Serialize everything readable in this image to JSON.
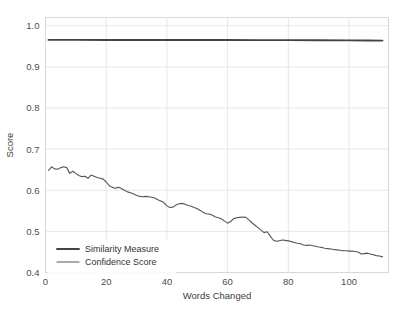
{
  "chart_data": {
    "type": "line",
    "title": "",
    "xlabel": "Words Changed",
    "ylabel": "Score",
    "xlim": [
      0,
      113
    ],
    "ylim": [
      0.4,
      1.02
    ],
    "xticks": [
      0,
      20,
      40,
      60,
      80,
      100
    ],
    "xtick_labels": [
      "0",
      "20",
      "40",
      "60",
      "80",
      "100"
    ],
    "yticks": [
      0.4,
      0.5,
      0.6,
      0.7,
      0.8,
      0.9,
      1.0
    ],
    "ytick_labels": [
      "0.4",
      "0.5",
      "0.6",
      "0.7",
      "0.8",
      "0.9",
      "1.0"
    ],
    "grid": true,
    "legend_position": "lower left",
    "colors": {
      "similarity_measure": "#444444",
      "confidence_score": "#555555",
      "grid": "#e3e3e3",
      "frame": "#d9d9d9",
      "text": "#3d3d3d"
    },
    "series": [
      {
        "name": "Similarity Measure",
        "x": [
          1,
          10,
          20,
          30,
          40,
          50,
          60,
          70,
          80,
          90,
          100,
          106,
          111
        ],
        "values": [
          0.9655,
          0.9655,
          0.9654,
          0.9654,
          0.9653,
          0.9653,
          0.9652,
          0.9651,
          0.965,
          0.9648,
          0.9645,
          0.9642,
          0.9638
        ]
      },
      {
        "name": "Confidence Score",
        "x": [
          1,
          2,
          3,
          4,
          5,
          6,
          7,
          8,
          9,
          10,
          11,
          12,
          13,
          14,
          15,
          16,
          17,
          18,
          19,
          20,
          21,
          22,
          23,
          24,
          25,
          26,
          27,
          28,
          29,
          30,
          31,
          32,
          33,
          34,
          35,
          36,
          37,
          38,
          39,
          40,
          41,
          42,
          43,
          44,
          45,
          46,
          47,
          48,
          49,
          50,
          51,
          52,
          53,
          54,
          55,
          56,
          57,
          58,
          59,
          60,
          61,
          62,
          63,
          64,
          65,
          66,
          67,
          68,
          69,
          70,
          71,
          72,
          73,
          74,
          75,
          76,
          77,
          78,
          79,
          80,
          81,
          82,
          83,
          84,
          85,
          86,
          87,
          88,
          89,
          90,
          91,
          92,
          93,
          94,
          95,
          96,
          97,
          98,
          99,
          100,
          101,
          102,
          103,
          104,
          105,
          106,
          107,
          108,
          109,
          110,
          111
        ],
        "values": [
          0.648,
          0.657,
          0.652,
          0.651,
          0.655,
          0.657,
          0.655,
          0.641,
          0.646,
          0.641,
          0.636,
          0.633,
          0.634,
          0.629,
          0.637,
          0.634,
          0.631,
          0.629,
          0.627,
          0.62,
          0.611,
          0.607,
          0.605,
          0.607,
          0.604,
          0.6,
          0.596,
          0.594,
          0.591,
          0.588,
          0.585,
          0.584,
          0.585,
          0.584,
          0.583,
          0.581,
          0.577,
          0.574,
          0.57,
          0.562,
          0.558,
          0.559,
          0.564,
          0.567,
          0.568,
          0.566,
          0.563,
          0.561,
          0.558,
          0.555,
          0.551,
          0.546,
          0.543,
          0.542,
          0.539,
          0.535,
          0.533,
          0.53,
          0.525,
          0.52,
          0.524,
          0.531,
          0.533,
          0.534,
          0.535,
          0.534,
          0.528,
          0.521,
          0.515,
          0.509,
          0.503,
          0.497,
          0.499,
          0.489,
          0.479,
          0.476,
          0.477,
          0.479,
          0.478,
          0.477,
          0.475,
          0.473,
          0.471,
          0.47,
          0.467,
          0.466,
          0.467,
          0.465,
          0.464,
          0.462,
          0.461,
          0.459,
          0.458,
          0.457,
          0.456,
          0.455,
          0.454,
          0.453,
          0.453,
          0.452,
          0.452,
          0.451,
          0.45,
          0.445,
          0.446,
          0.447,
          0.445,
          0.443,
          0.441,
          0.44,
          0.438
        ]
      }
    ],
    "legend": [
      {
        "label": "Similarity Measure",
        "color": "#444444",
        "width": 1.9
      },
      {
        "label": "Confidence Score",
        "color": "#555555",
        "width": 1.1
      }
    ]
  }
}
